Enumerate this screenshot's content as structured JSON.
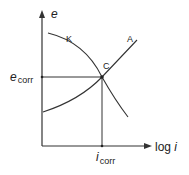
{
  "diagram": {
    "type": "Evans diagram (corrosion potential vs log current)",
    "axes": {
      "y_label": "e",
      "x_label_prefix": "log ",
      "x_label_var": "i"
    },
    "curves": [
      {
        "id": "cathodic",
        "label": "K"
      },
      {
        "id": "anodic",
        "label": "A"
      }
    ],
    "intersection": {
      "label": "C",
      "y_value_label_main": "e",
      "y_value_label_sub": "corr",
      "x_value_label_main": "i",
      "x_value_label_sub": "corr"
    },
    "colors": {
      "line": "#333333",
      "text": "#222222",
      "background": "#ffffff"
    }
  }
}
